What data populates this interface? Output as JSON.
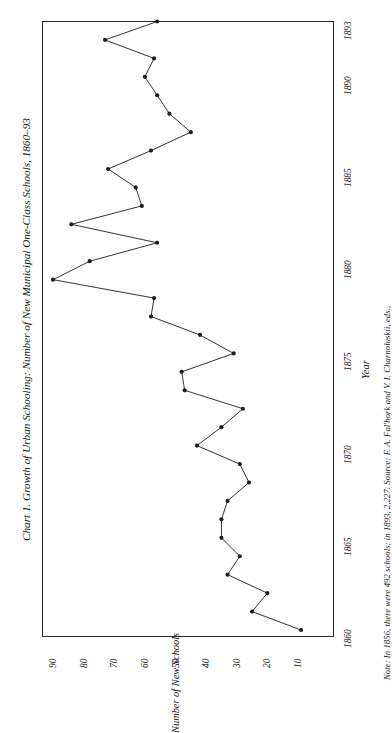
{
  "figure": {
    "title": "Chart 1. Growth of Urban Schooling: Number of New Municipal One-Class Schools, 1860–93",
    "note": "Note: In 1856, there were 492 schools; in 1893, 2,227. Source: F. A. Fal'bork and V. I. Charnoluskii, eds.,",
    "orientation": "rotated-90",
    "ink_color": "#1d1d1d",
    "paper_color": "#ffffff"
  },
  "chart_data": {
    "type": "line",
    "title": "Chart 1. Growth of Urban Schooling: Number of New Municipal One-Class Schools, 1860–93",
    "xlabel": "Year",
    "ylabel": "Number of New Schools",
    "xlim": [
      1860,
      1893
    ],
    "ylim": [
      0,
      95
    ],
    "grid": false,
    "legend": null,
    "marker": "filled-circle",
    "xticks": [
      1860,
      1865,
      1870,
      1875,
      1880,
      1885,
      1890,
      1893
    ],
    "xticklabels": [
      "1860",
      "1865",
      "1870",
      "1875",
      "1880",
      "1885",
      "1890",
      "1893"
    ],
    "yticks": [
      10,
      20,
      30,
      40,
      50,
      60,
      70,
      80,
      90
    ],
    "yticklabels": [
      "10",
      "20",
      "30",
      "40",
      "50",
      "60",
      "70",
      "80",
      "90"
    ],
    "x": [
      1860,
      1861,
      1862,
      1863,
      1864,
      1865,
      1866,
      1867,
      1868,
      1869,
      1870,
      1871,
      1872,
      1873,
      1874,
      1875,
      1876,
      1877,
      1878,
      1879,
      1880,
      1881,
      1882,
      1883,
      1884,
      1885,
      1886,
      1887,
      1888,
      1889,
      1890,
      1891,
      1892,
      1893
    ],
    "values": [
      9,
      25,
      20,
      33,
      29,
      35,
      35,
      33,
      26,
      29,
      43,
      35,
      28,
      47,
      48,
      31,
      42,
      58,
      57,
      90,
      78,
      56,
      84,
      61,
      63,
      72,
      58,
      45,
      52,
      56,
      60,
      57,
      73,
      56
    ],
    "series": [
      {
        "name": "New Municipal One-Class Schools",
        "points": [
          {
            "year": 1860,
            "schools": 9
          },
          {
            "year": 1861,
            "schools": 25
          },
          {
            "year": 1862,
            "schools": 20
          },
          {
            "year": 1863,
            "schools": 33
          },
          {
            "year": 1864,
            "schools": 29
          },
          {
            "year": 1865,
            "schools": 35
          },
          {
            "year": 1866,
            "schools": 35
          },
          {
            "year": 1867,
            "schools": 33
          },
          {
            "year": 1868,
            "schools": 26
          },
          {
            "year": 1869,
            "schools": 29
          },
          {
            "year": 1870,
            "schools": 43
          },
          {
            "year": 1871,
            "schools": 35
          },
          {
            "year": 1872,
            "schools": 28
          },
          {
            "year": 1873,
            "schools": 47
          },
          {
            "year": 1874,
            "schools": 48
          },
          {
            "year": 1875,
            "schools": 31
          },
          {
            "year": 1876,
            "schools": 42
          },
          {
            "year": 1877,
            "schools": 58
          },
          {
            "year": 1878,
            "schools": 57
          },
          {
            "year": 1879,
            "schools": 90
          },
          {
            "year": 1880,
            "schools": 78
          },
          {
            "year": 1881,
            "schools": 56
          },
          {
            "year": 1882,
            "schools": 84
          },
          {
            "year": 1883,
            "schools": 61
          },
          {
            "year": 1884,
            "schools": 63
          },
          {
            "year": 1885,
            "schools": 72
          },
          {
            "year": 1886,
            "schools": 58
          },
          {
            "year": 1887,
            "schools": 45
          },
          {
            "year": 1888,
            "schools": 52
          },
          {
            "year": 1889,
            "schools": 56
          },
          {
            "year": 1890,
            "schools": 60
          },
          {
            "year": 1891,
            "schools": 57
          },
          {
            "year": 1892,
            "schools": 73
          },
          {
            "year": 1893,
            "schools": 56
          }
        ]
      }
    ]
  }
}
